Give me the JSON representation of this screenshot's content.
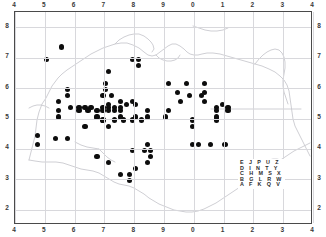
{
  "figure": {
    "kind": "distribution-dot-map",
    "background_color": "#ffffff",
    "frame_color": "#4a4a4a",
    "gridline_color": "#d8d8dc",
    "coastline_color": "#c9c9cf",
    "dot_color": "#0d0d0d"
  },
  "axes": {
    "top_ticks": [
      "4",
      "5",
      "6",
      "7",
      "8",
      "9",
      "0",
      "1",
      "2",
      "3",
      "4"
    ],
    "bottom_ticks": [
      "4",
      "5",
      "6",
      "7",
      "8",
      "9",
      "0",
      "1",
      "2",
      "3",
      "4"
    ],
    "left_ticks": [
      "8",
      "7",
      "6",
      "5",
      "4",
      "3",
      "2"
    ],
    "right_ticks": [
      "8",
      "7",
      "6",
      "5",
      "4",
      "3",
      "2"
    ]
  },
  "legend": {
    "name": "national-grid-letter-square",
    "rows": [
      "E J P U Z",
      "D I N T Y",
      "C H M S X",
      "B G L R W",
      "A F K Q V"
    ]
  },
  "chart_data": {
    "type": "scatter",
    "title": "",
    "xlabel": "",
    "ylabel": "",
    "xlim": [
      4,
      14
    ],
    "ylim": [
      1.5,
      8.5
    ],
    "grid": true,
    "legend_position": "bottom-right",
    "marker": "filled-circle",
    "x_tick_labels": [
      "4",
      "5",
      "6",
      "7",
      "8",
      "9",
      "0",
      "1",
      "2",
      "3",
      "4"
    ],
    "y_tick_labels": [
      "8",
      "7",
      "6",
      "5",
      "4",
      "3",
      "2"
    ],
    "series": [
      {
        "name": "records",
        "count": 118,
        "points": [
          [
            5.55,
            7.35
          ],
          [
            5.05,
            6.95
          ],
          [
            7.95,
            6.95
          ],
          [
            8.15,
            6.95
          ],
          [
            8.15,
            6.75
          ],
          [
            7.15,
            6.55
          ],
          [
            7.05,
            6.15
          ],
          [
            9.15,
            6.15
          ],
          [
            9.75,
            6.15
          ],
          [
            10.35,
            6.15
          ],
          [
            5.75,
            5.95
          ],
          [
            7.05,
            5.95
          ],
          [
            9.45,
            5.85
          ],
          [
            10.35,
            5.85
          ],
          [
            5.75,
            5.75
          ],
          [
            6.95,
            5.75
          ],
          [
            7.25,
            5.75
          ],
          [
            9.85,
            5.75
          ],
          [
            10.25,
            5.75
          ],
          [
            5.45,
            5.55
          ],
          [
            7.55,
            5.55
          ],
          [
            7.95,
            5.55
          ],
          [
            9.55,
            5.55
          ],
          [
            10.35,
            5.55
          ],
          [
            7.15,
            5.45
          ],
          [
            7.75,
            5.45
          ],
          [
            8.05,
            5.45
          ],
          [
            10.95,
            5.45
          ],
          [
            5.85,
            5.35
          ],
          [
            6.15,
            5.35
          ],
          [
            6.35,
            5.35
          ],
          [
            6.55,
            5.35
          ],
          [
            6.95,
            5.35
          ],
          [
            7.15,
            5.35
          ],
          [
            7.35,
            5.35
          ],
          [
            7.55,
            5.35
          ],
          [
            10.75,
            5.35
          ],
          [
            11.15,
            5.35
          ],
          [
            5.45,
            5.25
          ],
          [
            6.15,
            5.25
          ],
          [
            6.45,
            5.25
          ],
          [
            6.75,
            5.25
          ],
          [
            6.95,
            5.25
          ],
          [
            7.15,
            5.25
          ],
          [
            7.35,
            5.25
          ],
          [
            7.55,
            5.25
          ],
          [
            8.45,
            5.25
          ],
          [
            9.15,
            5.25
          ],
          [
            10.75,
            5.25
          ],
          [
            11.15,
            5.25
          ],
          [
            5.45,
            5.05
          ],
          [
            6.75,
            5.05
          ],
          [
            7.55,
            5.05
          ],
          [
            8.05,
            5.05
          ],
          [
            8.45,
            5.05
          ],
          [
            9.05,
            5.05
          ],
          [
            10.75,
            5.05
          ],
          [
            6.95,
            4.95
          ],
          [
            7.35,
            4.95
          ],
          [
            7.65,
            4.95
          ],
          [
            7.95,
            4.95
          ],
          [
            8.25,
            4.95
          ],
          [
            9.95,
            4.95
          ],
          [
            10.75,
            4.95
          ],
          [
            6.35,
            4.75
          ],
          [
            7.15,
            4.75
          ],
          [
            9.95,
            4.75
          ],
          [
            4.75,
            4.45
          ],
          [
            5.35,
            4.35
          ],
          [
            5.75,
            4.35
          ],
          [
            4.75,
            4.15
          ],
          [
            8.45,
            4.15
          ],
          [
            9.95,
            4.15
          ],
          [
            10.15,
            4.15
          ],
          [
            10.55,
            4.15
          ],
          [
            11.05,
            4.15
          ],
          [
            7.95,
            3.95
          ],
          [
            8.35,
            3.95
          ],
          [
            8.55,
            3.95
          ],
          [
            8.55,
            3.75
          ],
          [
            6.75,
            3.75
          ],
          [
            7.15,
            3.55
          ],
          [
            8.45,
            3.55
          ],
          [
            8.05,
            3.35
          ],
          [
            7.55,
            3.15
          ],
          [
            7.85,
            3.15
          ],
          [
            7.85,
            2.95
          ]
        ]
      }
    ]
  }
}
